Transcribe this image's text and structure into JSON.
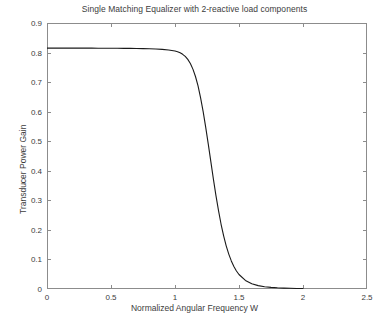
{
  "chart_data": {
    "type": "line",
    "title": "Single Matching Equalizer with 2-reactive load components",
    "xlabel": "Normalized Angular Frequency W",
    "ylabel": "Transducer Power Gain",
    "xlim": [
      0,
      2.5
    ],
    "ylim": [
      0,
      0.9
    ],
    "xticks": [
      "0",
      "0.5",
      "1",
      "1.5",
      "2",
      "2.5"
    ],
    "xtick_values": [
      0,
      0.5,
      1,
      1.5,
      2,
      2.5
    ],
    "yticks": [
      "0",
      "0.1",
      "0.2",
      "0.3",
      "0.4",
      "0.5",
      "0.6",
      "0.7",
      "0.8",
      "0.9"
    ],
    "ytick_values": [
      0,
      0.1,
      0.2,
      0.3,
      0.4,
      0.5,
      0.6,
      0.7,
      0.8,
      0.9
    ],
    "grid": false,
    "legend": false,
    "line_color": "#1a1a1a",
    "line_width": 1.1,
    "axis_color": "#8c8c8c",
    "background": "#ffffff",
    "series": [
      {
        "name": "Transducer Power Gain",
        "x": [
          0.0,
          0.05,
          0.1,
          0.15,
          0.2,
          0.25,
          0.3,
          0.35,
          0.4,
          0.45,
          0.5,
          0.55,
          0.6,
          0.65,
          0.7,
          0.75,
          0.8,
          0.85,
          0.9,
          0.95,
          1.0,
          1.02,
          1.04,
          1.06,
          1.08,
          1.1,
          1.12,
          1.14,
          1.16,
          1.18,
          1.2,
          1.22,
          1.24,
          1.26,
          1.28,
          1.3,
          1.32,
          1.34,
          1.36,
          1.38,
          1.4,
          1.42,
          1.44,
          1.46,
          1.48,
          1.5,
          1.55,
          1.6,
          1.65,
          1.7,
          1.75,
          1.8,
          1.85,
          1.9,
          1.95,
          2.0
        ],
        "y": [
          0.815,
          0.815,
          0.815,
          0.815,
          0.815,
          0.815,
          0.8149,
          0.8149,
          0.8148,
          0.8147,
          0.8146,
          0.8145,
          0.8143,
          0.8141,
          0.8138,
          0.8134,
          0.8128,
          0.812,
          0.8108,
          0.8088,
          0.805,
          0.8025,
          0.799,
          0.794,
          0.787,
          0.777,
          0.763,
          0.744,
          0.719,
          0.687,
          0.647,
          0.6,
          0.547,
          0.49,
          0.431,
          0.372,
          0.316,
          0.265,
          0.219,
          0.18,
          0.146,
          0.118,
          0.095,
          0.076,
          0.061,
          0.049,
          0.029,
          0.018,
          0.0115,
          0.0078,
          0.0055,
          0.004,
          0.003,
          0.0023,
          0.0018,
          0.0015
        ]
      }
    ]
  }
}
